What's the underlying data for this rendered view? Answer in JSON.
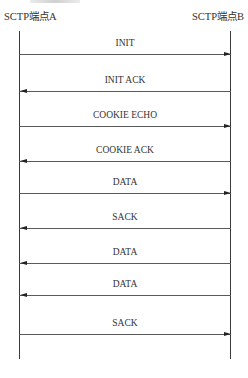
{
  "diagram": {
    "type": "sequence",
    "endpoints": {
      "a": {
        "label": "SCTP端点A"
      },
      "b": {
        "label": "SCTP端点B"
      }
    },
    "messages": [
      {
        "label": "INIT",
        "from": "A",
        "to": "B",
        "direction": "right",
        "y": 54
      },
      {
        "label": "INIT ACK",
        "from": "B",
        "to": "A",
        "direction": "left",
        "y": 91
      },
      {
        "label": "COOKIE ECHO",
        "from": "A",
        "to": "B",
        "direction": "right",
        "y": 126
      },
      {
        "label": "COOKIE ACK",
        "from": "B",
        "to": "A",
        "direction": "left",
        "y": 161
      },
      {
        "label": "DATA",
        "from": "A",
        "to": "B",
        "direction": "right",
        "y": 193
      },
      {
        "label": "SACK",
        "from": "B",
        "to": "A",
        "direction": "left",
        "y": 228
      },
      {
        "label": "DATA",
        "from": "B",
        "to": "A",
        "direction": "left",
        "y": 263
      },
      {
        "label": "DATA",
        "from": "B",
        "to": "A",
        "direction": "left",
        "y": 295
      },
      {
        "label": "SACK",
        "from": "A",
        "to": "B",
        "direction": "right",
        "y": 334
      }
    ]
  },
  "colors": {
    "line": "#5a5a5a",
    "lifeline": "#3a3a3a",
    "arrowhead": "#222222",
    "text": "#333333",
    "background": "#ffffff"
  }
}
